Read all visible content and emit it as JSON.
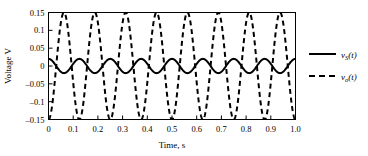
{
  "chart_data": {
    "type": "line",
    "title": "",
    "xlabel": "Time, s",
    "ylabel": "Voltage V",
    "xlim": [
      0,
      1.0
    ],
    "ylim": [
      -0.15,
      0.15
    ],
    "xticks": [
      0,
      0.1,
      0.2,
      0.3,
      0.4,
      0.5,
      0.6,
      0.7,
      0.8,
      0.9,
      1.0
    ],
    "xtick_labels": [
      "0",
      "0.1",
      "0.2",
      "0.3",
      "0.4",
      "0.5",
      "0.6",
      "0.7",
      "0.8",
      "0.9",
      "1.0"
    ],
    "yticks": [
      0.15,
      0.1,
      0.05,
      0,
      -0.05,
      -0.1,
      -0.15
    ],
    "ytick_labels": [
      "0.15",
      "0.1",
      "0.05",
      "0",
      "–0.05",
      "–0.1",
      "–0.15"
    ],
    "grid": false,
    "legend_position": "right-outside",
    "frequency_hz": 8,
    "series": [
      {
        "name": "vS(t)",
        "label_main": "v",
        "label_sub": "S",
        "label_tail": "(t)",
        "style": "solid",
        "color": "#000000",
        "linewidth": 2.0,
        "amplitude": 0.02,
        "offset": 0.0,
        "phase_deg": 0,
        "waveform": "cos"
      },
      {
        "name": "vo(t)",
        "label_main": "v",
        "label_sub": "o",
        "label_tail": "(t)",
        "style": "dashed",
        "color": "#000000",
        "linewidth": 2.0,
        "amplitude": 0.15,
        "offset": 0.0,
        "phase_deg": 180,
        "waveform": "cos"
      }
    ]
  },
  "axes": {
    "xlabel": "Time, s",
    "ylabel": "Voltage V"
  },
  "legend": {
    "entries": [
      {
        "main": "v",
        "sub": "S",
        "tail": "(t)",
        "style": "solid"
      },
      {
        "main": "v",
        "sub": "o",
        "tail": "(t)",
        "style": "dashed"
      }
    ]
  },
  "colors": {
    "frame": "#000000",
    "curve": "#000000",
    "background": "#ffffff"
  }
}
